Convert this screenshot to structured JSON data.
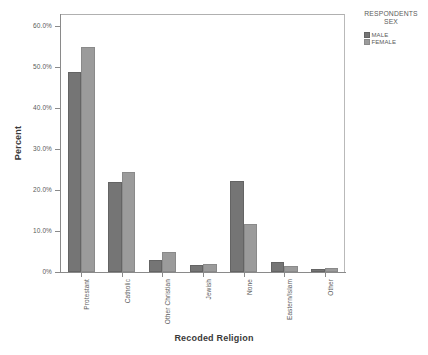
{
  "chart_data": {
    "type": "bar",
    "title": "",
    "xlabel": "Recoded Religion",
    "ylabel": "Percent",
    "categories": [
      "Protestant",
      "Catholic",
      "Other Christian",
      "Jewish",
      "None",
      "Eastern/Islam",
      "Other"
    ],
    "series": [
      {
        "name": "MALE",
        "color": "#757575",
        "values": [
          48.8,
          22.0,
          3.0,
          1.8,
          22.2,
          2.4,
          0.8
        ]
      },
      {
        "name": "FEMALE",
        "color": "#9b9b9b",
        "values": [
          55.0,
          24.5,
          4.9,
          1.9,
          11.8,
          1.5,
          0.9
        ]
      }
    ],
    "ylim": [
      0,
      63
    ],
    "yticks": [
      0,
      10,
      20,
      30,
      40,
      50,
      60
    ],
    "ytick_labels": [
      "0%",
      "10.0%",
      "20.0%",
      "30.0%",
      "40.0%",
      "50.0%",
      "60.0%"
    ],
    "grid": false,
    "legend_position": "right-top"
  },
  "legend": {
    "title_line1": "RESPONDENTS",
    "title_line2": "SEX",
    "items": [
      {
        "label": "MALE"
      },
      {
        "label": "FEMALE"
      }
    ]
  },
  "axes": {
    "y_title": "Percent",
    "x_title": "Recoded Religion"
  }
}
